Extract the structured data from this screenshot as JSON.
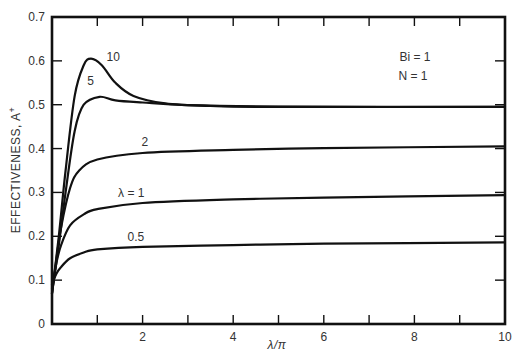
{
  "chart_data": {
    "type": "line",
    "title": "",
    "xlabel": "λ/π",
    "ylabel": "EFFECTIVENESS, A⁺",
    "xlim": [
      0,
      10
    ],
    "ylim": [
      0,
      0.7
    ],
    "x_ticks": [
      0,
      1,
      2,
      3,
      4,
      5,
      6,
      7,
      8,
      9,
      10
    ],
    "x_tick_labels": [
      "2",
      "4",
      "6",
      "8",
      "10"
    ],
    "x_tick_label_values": [
      2,
      4,
      6,
      8,
      10
    ],
    "y_ticks": [
      0,
      0.1,
      0.2,
      0.3,
      0.4,
      0.5,
      0.6,
      0.7
    ],
    "y_tick_labels": [
      "0",
      "0.1",
      "0.2",
      "0.3",
      "0.4",
      "0.5",
      "0.6",
      "0.7"
    ],
    "grid": false,
    "annotations": [
      "Bi = 1",
      "N = 1"
    ],
    "series": [
      {
        "name": "10",
        "label": "10",
        "x": [
          0,
          0.15,
          0.3,
          0.5,
          0.7,
          0.86,
          1.1,
          1.4,
          1.8,
          2.5,
          3.5,
          5,
          10
        ],
        "y": [
          0.07,
          0.2,
          0.35,
          0.52,
          0.59,
          0.605,
          0.59,
          0.55,
          0.52,
          0.503,
          0.497,
          0.495,
          0.495
        ]
      },
      {
        "name": "5",
        "label": "5",
        "x": [
          0,
          0.15,
          0.3,
          0.5,
          0.7,
          1.05,
          1.4,
          2,
          3,
          5,
          10
        ],
        "y": [
          0.07,
          0.18,
          0.3,
          0.44,
          0.5,
          0.518,
          0.51,
          0.505,
          0.499,
          0.496,
          0.495
        ]
      },
      {
        "name": "2",
        "label": "2",
        "x": [
          0,
          0.1,
          0.2,
          0.4,
          0.6,
          1,
          2,
          4,
          6,
          10
        ],
        "y": [
          0.07,
          0.15,
          0.22,
          0.31,
          0.35,
          0.375,
          0.39,
          0.397,
          0.401,
          0.405
        ]
      },
      {
        "name": "1",
        "label": "λ = 1",
        "x": [
          0,
          0.1,
          0.2,
          0.4,
          0.7,
          1,
          2,
          4,
          6,
          10
        ],
        "y": [
          0.08,
          0.14,
          0.18,
          0.225,
          0.25,
          0.262,
          0.276,
          0.284,
          0.288,
          0.294
        ]
      },
      {
        "name": "0.5",
        "label": "0.5",
        "x": [
          0,
          0.1,
          0.2,
          0.4,
          0.7,
          1,
          2,
          4,
          6,
          10
        ],
        "y": [
          0.09,
          0.115,
          0.13,
          0.15,
          0.163,
          0.17,
          0.176,
          0.18,
          0.183,
          0.186
        ]
      }
    ],
    "curve_label_positions": [
      {
        "text": "10",
        "x": 1.35,
        "y": 0.6
      },
      {
        "text": "5",
        "x": 0.85,
        "y": 0.545
      },
      {
        "text": "2",
        "x": 2.05,
        "y": 0.405
      },
      {
        "text": "λ = 1",
        "x": 1.75,
        "y": 0.29
      },
      {
        "text": "0.5",
        "x": 1.85,
        "y": 0.19
      }
    ]
  },
  "labels": {
    "x_axis": "λ/π",
    "y_axis": "EFFECTIVENESS, A",
    "y_axis_sup": "+",
    "bi": "Bi = 1",
    "n": "N = 1"
  }
}
